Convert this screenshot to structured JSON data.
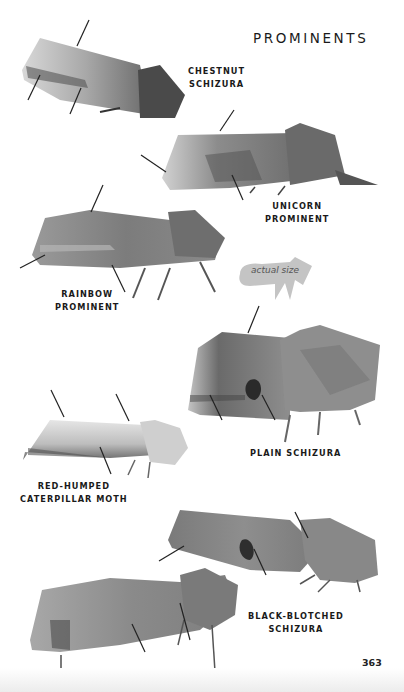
{
  "page": {
    "title": "PROMINENTS",
    "page_number": "363",
    "actual_size_label": "actual size"
  },
  "species": [
    {
      "name_line1": "CHESTNUT",
      "name_line2": "SCHIZURA"
    },
    {
      "name_line1": "UNICORN",
      "name_line2": "PROMINENT"
    },
    {
      "name_line1": "RAINBOW",
      "name_line2": "PROMINENT"
    },
    {
      "name_line1": "PLAIN SCHIZURA",
      "name_line2": ""
    },
    {
      "name_line1": "RED-HUMPED",
      "name_line2": "CATERPILLAR MOTH"
    },
    {
      "name_line1": "BLACK-BLOTCHED",
      "name_line2": "SCHIZURA"
    }
  ],
  "colors": {
    "background": "#ffffff",
    "text": "#1a1a1a",
    "moth_light": "#c9c9c9",
    "moth_mid": "#8a8a8a",
    "moth_dark": "#3c3c3c",
    "silhouette": "#bdbdbd"
  }
}
